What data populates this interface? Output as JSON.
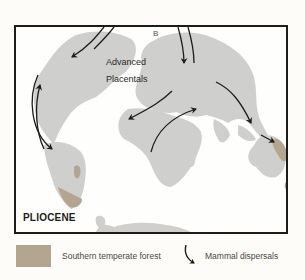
{
  "map": {
    "epoch_label": "PLIOCENE",
    "panel_letter": "B",
    "taxon_label_line1": "Advanced",
    "taxon_label_line2": "Placentals",
    "colors": {
      "land": "#cfcfcd",
      "southern_temperate_forest": "#b3a58f",
      "arrow": "#1e1c1a",
      "frame": "#1e1c1a"
    }
  },
  "legend": {
    "items": [
      {
        "key": "forest",
        "label": "Southern temperate forest",
        "symbol": "tan-swatch"
      },
      {
        "key": "dispersal",
        "label": "Mammal dispersals",
        "symbol": "curved-arrow-icon"
      }
    ]
  }
}
